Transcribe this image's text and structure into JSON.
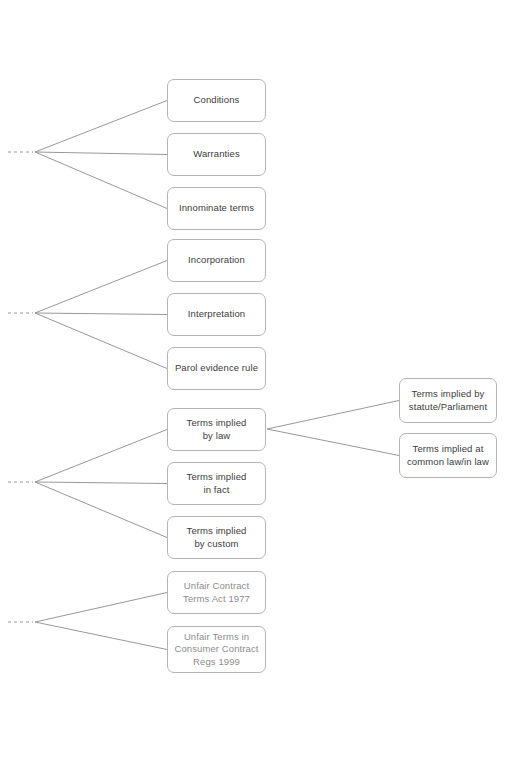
{
  "diagram": {
    "background_color": "#ffffff",
    "box_border_color": "#b4b4b4",
    "connector_color": "#8c8c8c",
    "text_color": "#3c3c3c",
    "muted_text_color": "#8c8c8c",
    "groups": [
      {
        "name": "group-terms-classification",
        "nodes": [
          {
            "id": "conditions",
            "label": "Conditions",
            "x": 167,
            "y": 79,
            "w": 99,
            "h": 43,
            "muted": false
          },
          {
            "id": "warranties",
            "label": "Warranties",
            "x": 167,
            "y": 133,
            "w": 99,
            "h": 43,
            "muted": false
          },
          {
            "id": "innominate-terms",
            "label": "Innominate terms",
            "x": 167,
            "y": 187,
            "w": 99,
            "h": 43,
            "muted": false
          }
        ],
        "vertex": {
          "x": 35,
          "y": 152
        },
        "stub": {
          "x1": 8,
          "x2": 33
        }
      },
      {
        "name": "group-terms-content",
        "nodes": [
          {
            "id": "incorporation",
            "label": "Incorporation",
            "x": 167,
            "y": 239,
            "w": 99,
            "h": 43,
            "muted": false
          },
          {
            "id": "interpretation",
            "label": "Interpretation",
            "x": 167,
            "y": 293,
            "w": 99,
            "h": 43,
            "muted": false
          },
          {
            "id": "parol-evidence-rule",
            "label": "Parol evidence rule",
            "x": 167,
            "y": 347,
            "w": 99,
            "h": 43,
            "muted": false
          }
        ],
        "vertex": {
          "x": 35,
          "y": 313
        },
        "stub": {
          "x1": 8,
          "x2": 33
        }
      },
      {
        "name": "group-implied-terms",
        "nodes": [
          {
            "id": "terms-implied-by-law",
            "label": "Terms implied\nby law",
            "x": 167,
            "y": 408,
            "w": 99,
            "h": 43,
            "muted": false
          },
          {
            "id": "terms-implied-in-fact",
            "label": "Terms implied\nin fact",
            "x": 167,
            "y": 462,
            "w": 99,
            "h": 43,
            "muted": false
          },
          {
            "id": "terms-implied-by-custom",
            "label": "Terms implied\nby custom",
            "x": 167,
            "y": 516,
            "w": 99,
            "h": 43,
            "muted": false
          }
        ],
        "vertex": {
          "x": 35,
          "y": 482
        },
        "stub": {
          "x1": 8,
          "x2": 33
        }
      },
      {
        "name": "group-unfair-terms-legislation",
        "nodes": [
          {
            "id": "unfair-contract-terms-act-1977",
            "label": "Unfair Contract\nTerms Act 1977",
            "x": 167,
            "y": 571,
            "w": 99,
            "h": 43,
            "muted": true
          },
          {
            "id": "unfair-terms-consumer-contract-regs-1999",
            "label": "Unfair Terms in\nConsumer Contract\nRegs 1999",
            "x": 167,
            "y": 626,
            "w": 99,
            "h": 47,
            "muted": true
          }
        ],
        "vertex": {
          "x": 35,
          "y": 622
        },
        "stub": {
          "x1": 8,
          "x2": 33
        }
      }
    ],
    "sub_branch": {
      "name": "sub-branch-implied-by-law",
      "source_id": "terms-implied-by-law",
      "vertex": {
        "x": 267,
        "y": 429
      },
      "nodes": [
        {
          "id": "terms-implied-by-statute",
          "label": "Terms implied by\nstatute/Parliament",
          "x": 399,
          "y": 378,
          "w": 98,
          "h": 45,
          "muted": false
        },
        {
          "id": "terms-implied-at-common-law",
          "label": "Terms implied at\ncommon law/in law",
          "x": 399,
          "y": 433,
          "w": 98,
          "h": 45,
          "muted": false
        }
      ]
    }
  }
}
